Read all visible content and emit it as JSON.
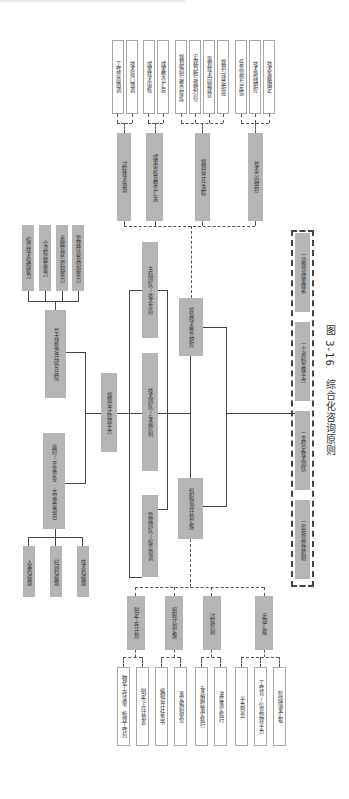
{
  "caption": {
    "figure_no": "图 3-16",
    "title": "综合化咨询原则"
  },
  "center": {
    "platform": "规划设计管理平台",
    "lead_team": "主持团队/技术支持",
    "tech_team": "技术团队/专项控制",
    "mgmt_team": "管理团队/综合协调",
    "value_control": "价值技术整合把控",
    "org_coord": "组织协调计划实施"
  },
  "left": {
    "institute": "华大建筑设计研究总院",
    "institute_caps": [
      "综合技术保障能力",
      "全过程统筹能力",
      "系统管理与控制能力",
      "管理经验及创新能力"
    ],
    "client": "政府/开发企业 大型建设项目",
    "client_needs": [
      "入事档级规",
      "时间档级规",
      "技术档级规"
    ]
  },
  "top_branches": [
    {
      "label": "过程技术协调",
      "leaves": [
        "工作界面协调",
        "技术接口协调"
      ]
    },
    {
      "label": "成果审核及整合汇总",
      "leaves": [
        "成果技术审核",
        "成果整合汇总"
      ]
    },
    {
      "label": "规划设计全流程",
      "leaves": [
        "规划编制与整合提炼",
        "宏观判断与规划引导",
        "策划技术问题建议",
        "规划与建设衔接"
      ]
    },
    {
      "label": "技术方向把控",
      "leaves": [
        "任务监管与反馈",
        "技术路线把控",
        "技术策略确定"
      ]
    }
  ],
  "bottom_branches": [
    {
      "label": "制定工作计划",
      "leaves": [
        "物化工作清单、梳理工作包",
        "制定节点计划表"
      ]
    },
    {
      "label": "组织计划实施",
      "leaves": [
        "编制设计任务书",
        "落实编制单位"
      ]
    },
    {
      "label": "过程控制",
      "leaves": [
        "专项跟踪落实执行",
        "进度落实执行"
      ]
    },
    {
      "label": "定期汇报",
      "leaves": [
        "平台例会",
        "工作营/信息管理平台",
        "阶段成果汇报"
      ]
    }
  ],
  "principles": [
    "一项规范成果体系",
    "一个资料支撑平台",
    "一支稳定技术团队",
    "一套运营管理机制"
  ]
}
